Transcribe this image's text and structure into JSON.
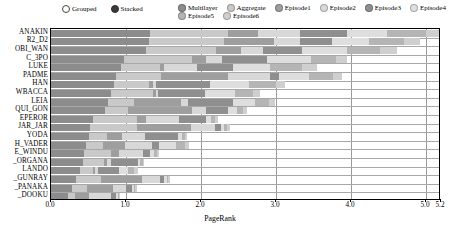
{
  "legend": {
    "mode": {
      "options": [
        {
          "label": "Grouped",
          "selected": false
        },
        {
          "label": "Stacked",
          "selected": true
        }
      ]
    },
    "series": [
      {
        "label": "Multilayer",
        "color": "#8c8c8c",
        "selected": true
      },
      {
        "label": "Aggregate",
        "color": "#c9c9c9",
        "selected": false
      },
      {
        "label": "Episode1",
        "color": "#9e9e9e",
        "selected": true
      },
      {
        "label": "Episode2",
        "color": "#d8d8d8",
        "selected": false
      },
      {
        "label": "Episode3",
        "color": "#8f8f8f",
        "selected": true
      },
      {
        "label": "Episode4",
        "color": "#dedede",
        "selected": false
      },
      {
        "label": "Episode5",
        "color": "#b5b5b5",
        "selected": true
      },
      {
        "label": "Episode6",
        "color": "#cfcfcf",
        "selected": false
      }
    ]
  },
  "axes": {
    "xlabel": "PageRank",
    "xticks": [
      "0.0",
      "1.0",
      "2.0",
      "3.0",
      "4.0",
      "5.0",
      "5.2"
    ],
    "xtick_values": [
      0.0,
      1.0,
      2.0,
      3.0,
      4.0,
      5.0,
      5.2
    ],
    "xlim": [
      0.0,
      5.2
    ],
    "ylabel": ""
  },
  "chart_data": {
    "type": "bar",
    "orientation": "horizontal",
    "stacked": true,
    "title": "",
    "xlabel": "PageRank",
    "ylabel": "",
    "xlim": [
      0.0,
      5.2
    ],
    "grid": true,
    "legend_position": "top",
    "categories": [
      "ANAKIN",
      "R2_D2",
      "OBI_WAN",
      "C_3PO",
      "LUKE",
      "PADME",
      "HAN",
      "WBACCA",
      "LEIA",
      "QUI_GON",
      "EPEROR",
      "JAR_JAR",
      "YODA",
      "H_VADER",
      "E_WINDU",
      "_ORGANA",
      "LANDO",
      "_GUNRAY",
      "_PANAKA",
      "_DOOKU"
    ],
    "series": [
      {
        "name": "Multilayer",
        "color": "#8c8c8c",
        "values": [
          1.32,
          1.3,
          1.26,
          0.97,
          0.93,
          0.86,
          0.84,
          0.8,
          0.76,
          0.72,
          0.56,
          0.52,
          0.5,
          0.47,
          0.44,
          0.42,
          0.38,
          0.33,
          0.28,
          0.22
        ]
      },
      {
        "name": "Aggregate",
        "color": "#c9c9c9",
        "values": [
          1.04,
          1.0,
          0.94,
          0.91,
          0.52,
          0.6,
          0.46,
          0.56,
          0.35,
          0.3,
          0.58,
          0.62,
          0.25,
          0.22,
          0.36,
          0.28,
          0.18,
          0.33,
          0.2,
          0.1
        ]
      },
      {
        "name": "Episode1",
        "color": "#9e9e9e",
        "values": [
          0.4,
          0.67,
          0.33,
          0.18,
          0.05,
          0.9,
          0.06,
          0.04,
          0.62,
          0.86,
          0.12,
          0.72,
          0.2,
          0.3,
          0.1,
          0.04,
          0.03,
          0.55,
          0.34,
          0.18
        ]
      },
      {
        "name": "Episode2",
        "color": "#d8d8d8",
        "values": [
          0.56,
          0.35,
          0.3,
          0.22,
          0.44,
          0.56,
          0.04,
          0.03,
          0.09,
          0.18,
          0.44,
          0.33,
          0.3,
          0.36,
          0.32,
          0.06,
          0.04,
          0.24,
          0.18,
          0.3
        ]
      },
      {
        "name": "Episode3",
        "color": "#8f8f8f",
        "values": [
          0.62,
          0.42,
          0.52,
          0.6,
          0.48,
          0.12,
          0.72,
          0.62,
          0.6,
          0.3,
          0.36,
          0.08,
          0.44,
          0.09,
          0.1,
          0.36,
          0.28,
          0.06,
          0.08,
          0.07
        ]
      },
      {
        "name": "Episode4",
        "color": "#dedede",
        "values": [
          0.54,
          0.5,
          0.6,
          0.58,
          0.5,
          0.4,
          0.52,
          0.4,
          0.3,
          0.12,
          0.07,
          0.04,
          0.05,
          0.22,
          0.05,
          0.03,
          0.12,
          0.03,
          0.02,
          0.02
        ]
      },
      {
        "name": "Episode5",
        "color": "#b5b5b5",
        "values": [
          0.52,
          0.46,
          0.44,
          0.34,
          0.42,
          0.32,
          0.36,
          0.24,
          0.18,
          0.08,
          0.06,
          0.04,
          0.04,
          0.12,
          0.04,
          0.03,
          0.08,
          0.02,
          0.02,
          0.02
        ]
      },
      {
        "name": "Episode6",
        "color": "#cfcfcf",
        "values": [
          0.28,
          0.22,
          0.22,
          0.14,
          0.2,
          0.12,
          0.12,
          0.1,
          0.08,
          0.05,
          0.04,
          0.03,
          0.03,
          0.06,
          0.03,
          0.02,
          0.05,
          0.02,
          0.02,
          0.01
        ]
      }
    ]
  }
}
